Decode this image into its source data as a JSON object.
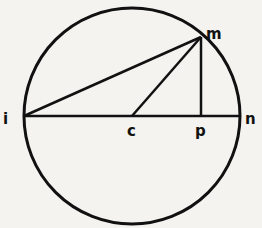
{
  "diagram": {
    "type": "geometry",
    "labels": {
      "i": "i",
      "m": "m",
      "c": "c",
      "p": "p",
      "n": "n"
    },
    "segments": [
      "i-n",
      "i-m",
      "c-m",
      "m-p"
    ],
    "colors": {
      "ink": "#111111",
      "background": "#f4f3f0"
    }
  }
}
